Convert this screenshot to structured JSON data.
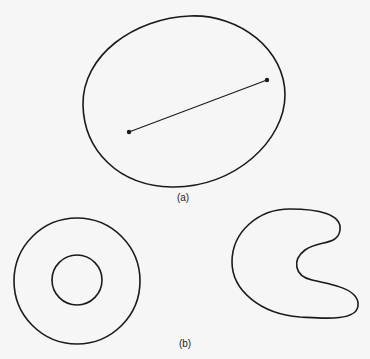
{
  "figure": {
    "background": "#f6f6f6",
    "stroke_color": "#1a1a1a",
    "panel_a": {
      "label": "(a)",
      "description": "convex region with line segment joining two interior points",
      "points": [
        [
          129,
          132
        ],
        [
          267,
          80
        ]
      ]
    },
    "panel_b": {
      "label": "(b)",
      "annulus": {
        "cx": 77,
        "cy": 281,
        "outer_r": 63,
        "inner_r": 25
      },
      "description": "non-convex regions: annulus and kidney shape"
    }
  }
}
